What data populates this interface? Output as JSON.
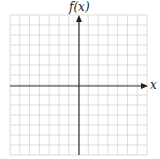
{
  "diagram": {
    "type": "coordinate-grid",
    "y_axis_label": "f(x)",
    "x_axis_label": "x",
    "grid": {
      "columns": 14,
      "rows": 14,
      "line_color": "#d0d0d0",
      "axis_color": "#333333"
    },
    "colors": {
      "background": "#ffffff",
      "grid": "#d0d0d0",
      "axis": "#333333"
    }
  }
}
